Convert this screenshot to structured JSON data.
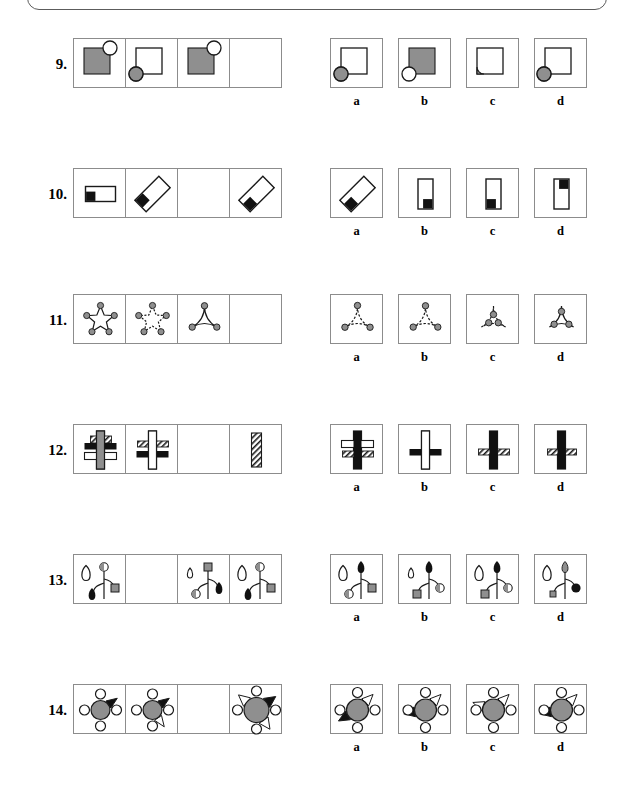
{
  "document": {
    "type": "non-verbal-reasoning-test",
    "page_description": "Matrix reasoning puzzles, questions 9 through 14, each with four answer options labelled a, b, c, d",
    "option_labels": [
      "a",
      "b",
      "c",
      "d"
    ],
    "colors": {
      "cell_border": "#8c8c8c",
      "shape_outline": "#1a1a1a",
      "gray_fill": "#8f8f8f",
      "black_fill": "#111111",
      "white_fill": "#ffffff",
      "page_background": "#ffffff"
    }
  },
  "questions": [
    {
      "number": "9.",
      "top": 38,
      "matrix_description": "Square with attached circle; fourth cell blank",
      "cells": [
        {
          "kind": "sq-circle",
          "square": "gray",
          "circle": "white",
          "corner": "tr",
          "blank": false
        },
        {
          "kind": "sq-circle",
          "square": "white",
          "circle": "gray",
          "corner": "bl",
          "blank": false
        },
        {
          "kind": "sq-circle",
          "square": "gray",
          "circle": "white",
          "corner": "tr",
          "blank": false
        },
        {
          "kind": "blank",
          "blank": true
        }
      ],
      "options": [
        {
          "label": "a",
          "kind": "sq-circle",
          "square": "white",
          "circle": "gray",
          "corner": "bl"
        },
        {
          "label": "b",
          "kind": "sq-circle",
          "square": "gray",
          "circle": "white",
          "corner": "bl"
        },
        {
          "label": "c",
          "kind": "sq-circle-cut",
          "square": "white",
          "circle": "gray",
          "corner": "bl"
        },
        {
          "label": "d",
          "kind": "sq-circle",
          "square": "white",
          "circle": "gray",
          "corner": "bl-out"
        }
      ]
    },
    {
      "number": "10.",
      "top": 168,
      "matrix_description": "Rectangle with small black square at a corner, rotating; third cell blank",
      "cells": [
        {
          "kind": "rect-sq",
          "rotate": 0,
          "orient": "wide",
          "sqpos": "bl",
          "blank": false
        },
        {
          "kind": "rect-sq",
          "rotate": -45,
          "orient": "wide",
          "sqpos": "tl",
          "blank": false
        },
        {
          "kind": "blank",
          "blank": true
        },
        {
          "kind": "rect-sq",
          "rotate": -45,
          "orient": "wide",
          "sqpos": "bl",
          "blank": false
        }
      ],
      "options": [
        {
          "label": "a",
          "kind": "rect-sq",
          "rotate": -45,
          "orient": "wide",
          "sqpos": "bl"
        },
        {
          "label": "b",
          "kind": "rect-sq",
          "rotate": 0,
          "orient": "tall",
          "sqpos": "br"
        },
        {
          "label": "c",
          "kind": "rect-sq",
          "rotate": 0,
          "orient": "tall",
          "sqpos": "bl"
        },
        {
          "label": "d",
          "kind": "rect-sq",
          "rotate": 0,
          "orient": "tall",
          "sqpos": "tr"
        }
      ]
    },
    {
      "number": "11.",
      "top": 294,
      "matrix_description": "Stars with gray dots on points; point count decreases; fourth cell blank",
      "cells": [
        {
          "kind": "star",
          "points": 5,
          "style": "solid",
          "dots": 5,
          "blank": false
        },
        {
          "kind": "star",
          "points": 5,
          "style": "dashed",
          "dots": 5,
          "blank": false
        },
        {
          "kind": "star",
          "points": 3,
          "style": "solid",
          "dots": 3,
          "blank": false
        },
        {
          "kind": "blank",
          "blank": true
        }
      ],
      "options": [
        {
          "label": "a",
          "kind": "star",
          "points": 3,
          "style": "mixed",
          "dots": 3,
          "dotpos": "spread"
        },
        {
          "label": "b",
          "kind": "star",
          "points": 3,
          "style": "mixed",
          "dots": 3,
          "dotpos": "outer"
        },
        {
          "label": "c",
          "kind": "star",
          "points": 3,
          "style": "mixed",
          "dots": 3,
          "dotpos": "center"
        },
        {
          "label": "d",
          "kind": "star",
          "points": 3,
          "style": "solid",
          "dots": 3,
          "dotpos": "inner"
        }
      ]
    },
    {
      "number": "12.",
      "top": 424,
      "matrix_description": "Vertical bar crossed by horizontal bars with solid, hollow and hatched fills; third cell blank",
      "cells": [
        {
          "kind": "cross",
          "vert": "gray",
          "bars": [
            "hatch-top",
            "black",
            "white"
          ],
          "blank": false
        },
        {
          "kind": "cross",
          "vert": "white",
          "bars": [
            "hatch",
            "black"
          ],
          "blank": false
        },
        {
          "kind": "blank",
          "blank": true
        },
        {
          "kind": "vertonly",
          "vert": "hatch",
          "blank": false
        }
      ],
      "options": [
        {
          "label": "a",
          "kind": "cross",
          "vert": "black",
          "bars": [
            "white",
            "hatch"
          ]
        },
        {
          "label": "b",
          "kind": "cross",
          "vert": "white",
          "bars": [
            "black"
          ]
        },
        {
          "label": "c",
          "kind": "cross",
          "vert": "black",
          "bars": [
            "hatch"
          ]
        },
        {
          "label": "d",
          "kind": "cross",
          "vert": "black",
          "bars": [
            "hatch-narrow"
          ]
        }
      ]
    },
    {
      "number": "13.",
      "top": 554,
      "matrix_description": "Plant-like stem with droplets, circles and squares; second cell blank",
      "cells": [
        {
          "kind": "plant",
          "topleft": "drop-big-white",
          "topright": "circle-half",
          "branch": "drop-black",
          "side": "square-gray",
          "blank": false
        },
        {
          "kind": "blank",
          "blank": true
        },
        {
          "kind": "plant",
          "topleft": "drop-small-white",
          "topright": "square-gray",
          "branch": "circle-half",
          "side": "drop-black",
          "blank": false
        },
        {
          "kind": "plant",
          "topleft": "drop-big-white",
          "topright": "circle-half",
          "branch": "drop-black",
          "side": "square-gray",
          "blank": false
        }
      ],
      "options": [
        {
          "label": "a",
          "kind": "plant",
          "topleft": "drop-big-white",
          "topright": "drop-black",
          "branch": "circle-half",
          "side": "square-gray"
        },
        {
          "label": "b",
          "kind": "plant",
          "topleft": "drop-small-white",
          "topright": "drop-black",
          "branch": "square-gray",
          "side": "circle-half"
        },
        {
          "label": "c",
          "kind": "plant",
          "topleft": "drop-big-white",
          "topright": "drop-black",
          "branch": "square-gray",
          "side": "circle-half"
        },
        {
          "label": "d",
          "kind": "plant",
          "topleft": "drop-big-white",
          "topright": "drop-gray",
          "branch": "square-small-gray",
          "side": "circle-black"
        }
      ]
    },
    {
      "number": "14.",
      "top": 684,
      "matrix_description": "Gray hexagon/circle with white circles and triangles around it; third cell blank",
      "cells": [
        {
          "kind": "hexwheel",
          "size": "small",
          "circles": 3,
          "tri_black": 1,
          "tri_white": 0,
          "blank": false
        },
        {
          "kind": "hexwheel",
          "size": "small",
          "circles": 3,
          "tri_black": 1,
          "tri_white": 1,
          "blank": false
        },
        {
          "kind": "blank",
          "blank": true
        },
        {
          "kind": "hexwheel",
          "size": "large",
          "circles": 3,
          "tri_black": 1,
          "tri_white": 2,
          "blank": false
        }
      ],
      "options": [
        {
          "label": "a",
          "kind": "hexwheel",
          "size": "med",
          "circles": 4,
          "tri_black": 1,
          "tri_white": 1,
          "variant": "a"
        },
        {
          "label": "b",
          "kind": "hexwheel",
          "size": "med",
          "circles": 4,
          "tri_black": 1,
          "tri_white": 1,
          "variant": "b"
        },
        {
          "label": "c",
          "kind": "hexwheel",
          "size": "med",
          "circles": 4,
          "tri_black": 0,
          "tri_white": 2,
          "variant": "c"
        },
        {
          "label": "d",
          "kind": "hexwheel",
          "size": "med",
          "circles": 4,
          "tri_black": 1,
          "tri_white": 1,
          "variant": "d"
        }
      ]
    }
  ]
}
